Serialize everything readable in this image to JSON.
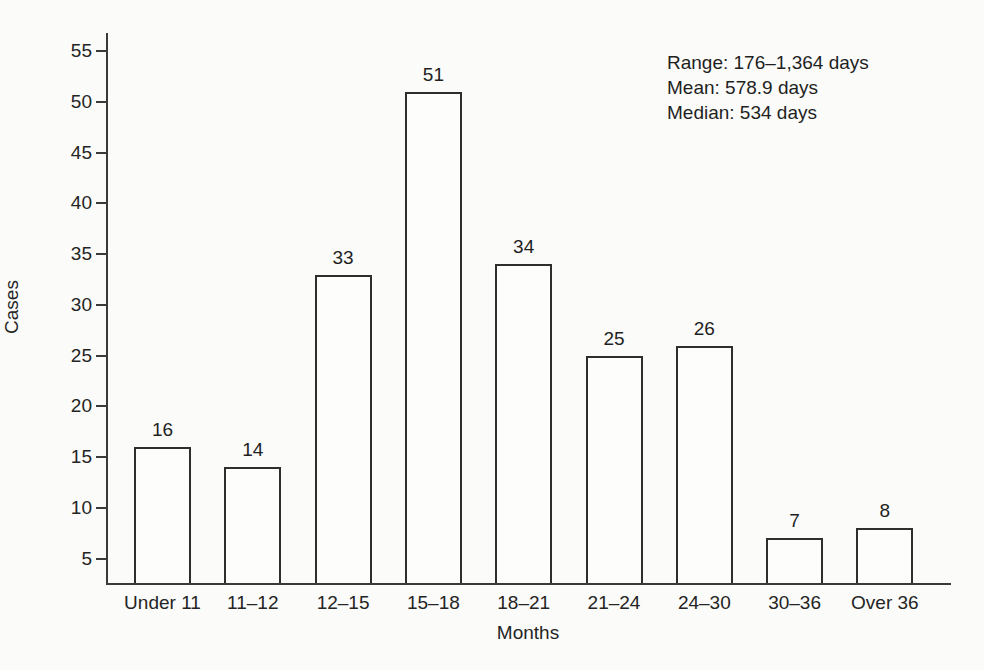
{
  "figure": {
    "background_color": "#fbfbf9",
    "ink_color": "#2e2e2e"
  },
  "chart_data": {
    "type": "bar",
    "categories": [
      "Under 11",
      "11–12",
      "12–15",
      "15–18",
      "18–21",
      "21–24",
      "24–30",
      "30–36",
      "Over 36"
    ],
    "values": [
      16,
      14,
      33,
      51,
      34,
      25,
      26,
      7,
      8
    ],
    "xlabel": "Months",
    "ylabel": "Cases",
    "yticks": [
      5,
      10,
      15,
      20,
      25,
      30,
      35,
      40,
      45,
      50,
      55
    ],
    "ylim": [
      2.6,
      56.8
    ],
    "grid": false,
    "legend": "none",
    "bar_fill": "#fdfdfc",
    "bar_stroke": "#2e2e2e",
    "annotations": [
      "Range: 176–1,364 days",
      "Mean: 578.9 days",
      "Median: 534 days"
    ]
  }
}
